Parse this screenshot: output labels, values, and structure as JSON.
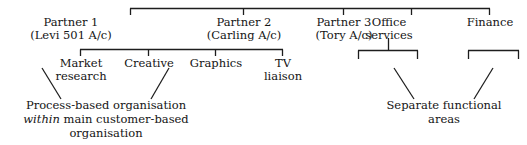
{
  "diagram": {
    "type": "organisation-chart",
    "line_color": "#1d1d1d",
    "text_color": "#141414",
    "background": "#ffffff",
    "level1": [
      {
        "id": "partner-1",
        "line1": "Partner 1",
        "line2": "(Levi 501 A/c)"
      },
      {
        "id": "partner-2",
        "line1": "Partner 2",
        "line2": "(Carling A/c)"
      },
      {
        "id": "partner-3",
        "line1": "Partner 3",
        "line2": "(Tory A/c)"
      },
      {
        "id": "office-services",
        "line1": "Office",
        "line2": "services"
      },
      {
        "id": "finance",
        "line1": "Finance",
        "line2": ""
      }
    ],
    "level2": [
      {
        "id": "market-research",
        "line1": "Market",
        "line2": "research"
      },
      {
        "id": "creative",
        "line1": "Creative",
        "line2": ""
      },
      {
        "id": "graphics",
        "line1": "Graphics",
        "line2": ""
      },
      {
        "id": "tv-liaison",
        "line1": "TV",
        "line2": "liaison"
      }
    ],
    "captions": [
      {
        "id": "process-based-caption",
        "line1": "Process-based organisation",
        "line2_italic": "within",
        "line2_rest": " main customer-based",
        "line3": "organisation"
      },
      {
        "id": "separate-functional-caption",
        "line1": "Separate functional",
        "line2": "areas",
        "line3": ""
      }
    ]
  }
}
